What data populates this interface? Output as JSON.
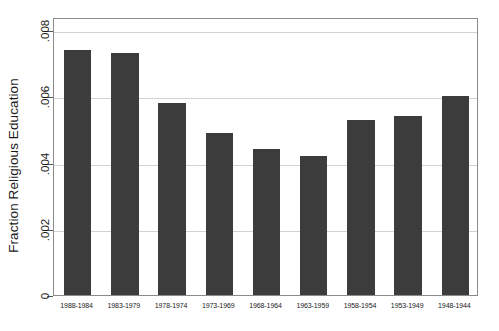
{
  "chart_data": {
    "type": "bar",
    "title": "",
    "xlabel": "",
    "ylabel": "Fraction Religious Education",
    "categories": [
      "1988-1984",
      "1983-1979",
      "1978-1974",
      "1973-1969",
      "1968-1964",
      "1963-1959",
      "1958-1954",
      "1953-1949",
      "1948-1944"
    ],
    "values": [
      0.0074,
      0.0073,
      0.0058,
      0.0049,
      0.0044,
      0.0042,
      0.0053,
      0.0054,
      0.006
    ],
    "ylim": [
      0,
      0.0084
    ],
    "y_ticks": [
      0,
      0.002,
      0.004,
      0.006,
      0.008
    ],
    "y_tick_labels": [
      "0",
      ".002",
      ".004",
      ".006",
      ".008"
    ],
    "grid": true,
    "legend": false,
    "bar_color": "#3c3c3c",
    "grid_color": "#d2d2d2",
    "frame_color": "#8a8a8a",
    "background_color": "#ffffff"
  }
}
